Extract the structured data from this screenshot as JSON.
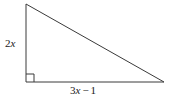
{
  "figure": {
    "type": "right-triangle",
    "background_color": "#ffffff",
    "stroke_color": "#3a3a3a",
    "stroke_width": 1,
    "text_color": "#1a1a1a"
  },
  "labels": {
    "vertical_side": {
      "coefficient": "2",
      "variable": "x",
      "full_text": "2x"
    },
    "horizontal_side": {
      "coefficient": "3",
      "variable": "x",
      "operator": "−",
      "constant": "1",
      "full_text": "3x − 1"
    }
  },
  "geometry": {
    "vertices": {
      "top_left": [
        26,
        4
      ],
      "bottom_left": [
        26,
        82
      ],
      "bottom_right": [
        164,
        82
      ]
    },
    "right_angle_marker": {
      "at_vertex": "bottom_left",
      "size": 8
    }
  }
}
